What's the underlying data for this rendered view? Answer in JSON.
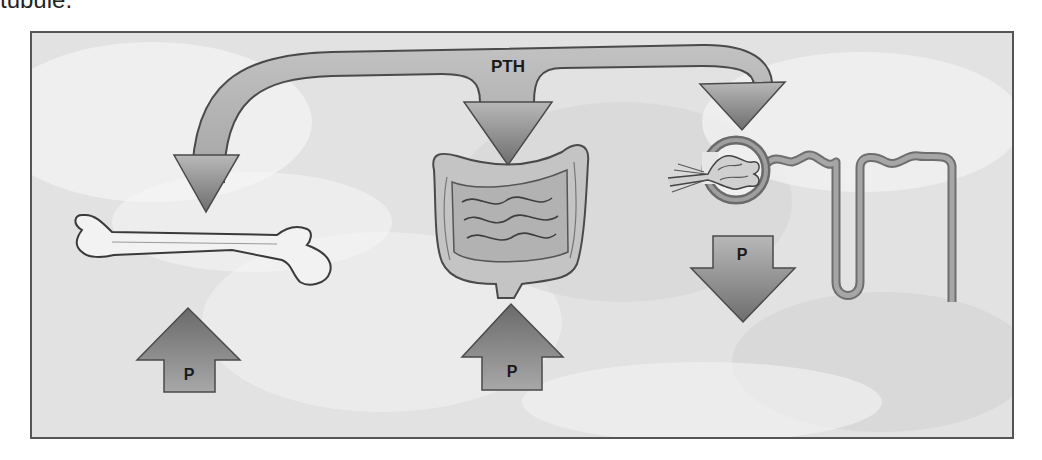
{
  "caption_fragment": "tubule.",
  "diagram": {
    "hormone_label": "PTH",
    "targets": [
      {
        "organ": "bone",
        "effect_label": "P",
        "effect_direction": "up"
      },
      {
        "organ": "intestine",
        "effect_label": "P",
        "effect_direction": "up"
      },
      {
        "organ": "kidney-nephron",
        "effect_label": "P",
        "effect_direction": "down"
      }
    ]
  },
  "colors": {
    "background": "#e6e6e6",
    "arrow_fill": "#8a8a8a",
    "arrow_stroke": "#4a4a4a",
    "organ_fill": "#b5b5b5",
    "organ_stroke": "#555555"
  }
}
